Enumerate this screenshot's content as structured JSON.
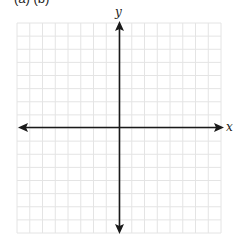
{
  "header": {
    "clipped_text": "(a)  (b)"
  },
  "chart_data": {
    "type": "coordinate-plane",
    "title": "",
    "xlabel": "x",
    "ylabel": "y",
    "grid": true,
    "grid_columns": 16,
    "grid_rows": 16,
    "tick_labels": [],
    "data_points": []
  },
  "axes": {
    "x_label": "x",
    "y_label": "y"
  },
  "colors": {
    "grid": "#e4e4e4",
    "axis": "#1a1a1a",
    "background": "#ffffff"
  }
}
